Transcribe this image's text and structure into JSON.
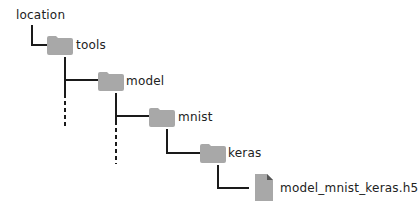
{
  "tree": {
    "root": "location",
    "nodes": [
      {
        "name": "tools",
        "type": "folder",
        "depth": 1
      },
      {
        "name": "model",
        "type": "folder",
        "depth": 2
      },
      {
        "name": "mnist",
        "type": "folder",
        "depth": 3
      },
      {
        "name": "keras",
        "type": "folder",
        "depth": 4
      },
      {
        "name": "model_mnist_keras.h5",
        "type": "file",
        "depth": 5
      }
    ]
  },
  "colors": {
    "icon": "#a8a8a8",
    "line": "#1a1a1a"
  },
  "icons": {
    "folder": "folder-icon",
    "file": "file-icon"
  }
}
